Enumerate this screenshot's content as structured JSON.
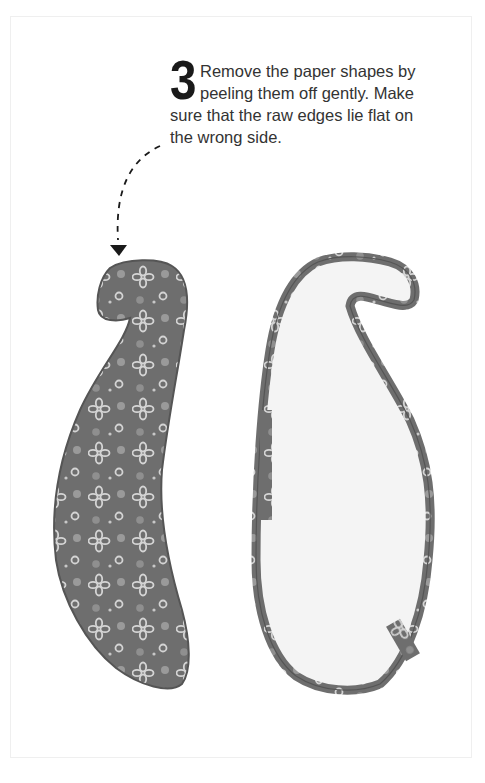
{
  "step": {
    "number": "3",
    "lines": [
      "Remove the paper shapes by",
      "peeling them off gently. Make",
      "sure that the raw edges lie flat on",
      "the wrong side."
    ]
  },
  "illustrations": {
    "left_shape": "paisley-fabric-right-side",
    "right_shape": "paisley-fabric-wrong-side",
    "arrow": "dashed-curved-arrow-down"
  },
  "colors": {
    "text": "#333333",
    "number": "#1a1a1a",
    "fabric": "#6e6e6e",
    "fabric_dark": "#555555",
    "motif": "#d4d4d4",
    "wrong_side": "#f4f4f4",
    "border": "#efefef"
  }
}
